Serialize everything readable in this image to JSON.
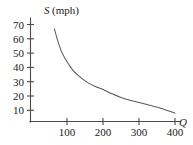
{
  "chart_data": {
    "type": "line",
    "title": "",
    "subtitle": "",
    "xlabel": "Q",
    "ylabel": "S (mph)",
    "ylabel_variable": "S",
    "ylabel_unit": "(mph)",
    "xlim": [
      0,
      440
    ],
    "ylim": [
      0,
      76
    ],
    "grid": false,
    "legend": false,
    "legend_position": "none",
    "x_ticks": [
      100,
      200,
      300,
      400
    ],
    "x_tick_labels": [
      "100",
      "200",
      "300",
      "400"
    ],
    "y_ticks": [
      10,
      20,
      30,
      40,
      50,
      60,
      70
    ],
    "y_tick_labels": [
      "10",
      "20",
      "30",
      "40",
      "50",
      "60",
      "70"
    ],
    "series": [
      {
        "name": "speed-vs-quantity",
        "color": "#5a5a5a",
        "x": [
          65,
          75,
          85,
          95,
          105,
          120,
          140,
          160,
          180,
          200,
          225,
          250,
          275,
          300,
          330,
          360,
          400
        ],
        "y": [
          67,
          58,
          51,
          46,
          42,
          37,
          32.5,
          29,
          26.5,
          24.5,
          21.5,
          19,
          17,
          15.5,
          13.5,
          11.5,
          8
        ]
      }
    ],
    "annotations": []
  },
  "axis_labels": {
    "y_title_variable": "S",
    "y_title_unit": "(mph)",
    "x_title": "Q"
  },
  "ticks": {
    "y": [
      "70",
      "60",
      "50",
      "40",
      "30",
      "20",
      "10"
    ],
    "x": [
      "100",
      "200",
      "300",
      "400"
    ]
  },
  "colors": {
    "curve": "#5a5a5a",
    "axis": "#4a4a4a",
    "text": "#1a1a1a",
    "background": "#ffffff"
  }
}
